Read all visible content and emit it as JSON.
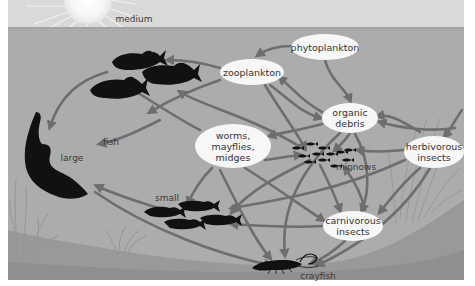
{
  "diagram": {
    "colors": {
      "sky": "#d9d9d9",
      "water": "#acacac",
      "water_deep": "#a2a2a2",
      "sediment": "#8f8f8f",
      "arrow": "#6e6e6e",
      "node_fill": "#f7f7f7",
      "organism": "#111111",
      "plants": "#979797"
    },
    "nodes": [
      {
        "id": "phytoplankton",
        "label": "phytoplankton",
        "x": 325,
        "y": 47,
        "w": 68,
        "h": 26
      },
      {
        "id": "zooplankton",
        "label": "zooplankton",
        "x": 252,
        "y": 72,
        "w": 64,
        "h": 26
      },
      {
        "id": "organic_debris",
        "label": "organic\ndebris",
        "x": 350,
        "y": 118,
        "w": 56,
        "h": 30
      },
      {
        "id": "worms",
        "label": "worms,\nmayflies,\nmidges",
        "x": 233,
        "y": 146,
        "w": 76,
        "h": 44
      },
      {
        "id": "herbivorous_insects",
        "label": "herbivorous\ninsects",
        "x": 434,
        "y": 152,
        "w": 60,
        "h": 32
      },
      {
        "id": "carnivorous_insects",
        "label": "carnivorous\ninsects",
        "x": 353,
        "y": 226,
        "w": 60,
        "h": 30
      }
    ],
    "labels": [
      {
        "id": "medium",
        "text": "medium",
        "x": 134,
        "y": 19
      },
      {
        "id": "fish",
        "text": "fish",
        "x": 111,
        "y": 142
      },
      {
        "id": "large",
        "text": "large",
        "x": 72,
        "y": 158
      },
      {
        "id": "small",
        "text": "small",
        "x": 167,
        "y": 198
      },
      {
        "id": "minnows",
        "text": "minnows",
        "x": 356,
        "y": 167
      },
      {
        "id": "crayfish",
        "text": "crayfish",
        "x": 318,
        "y": 276
      }
    ],
    "organisms": [
      {
        "id": "medium-fish",
        "count": 3
      },
      {
        "id": "large-fish",
        "count": 1
      },
      {
        "id": "small-fish",
        "count": 4
      },
      {
        "id": "minnows",
        "count": 12
      },
      {
        "id": "crayfish",
        "count": 1
      }
    ],
    "arrows": [
      {
        "from": "phytoplankton",
        "to": "zooplankton",
        "d": "M292,46 C280,46 268,48 258,55"
      },
      {
        "from": "phytoplankton",
        "to": "organic_debris",
        "d": "M325,60 C330,80 345,88 350,100"
      },
      {
        "from": "zooplankton",
        "to": "medium fish",
        "d": "M220,68 C200,62 185,60 168,60"
      },
      {
        "from": "organic_debris",
        "to": "zooplankton",
        "d": "M322,112 C300,100 295,90 280,78"
      },
      {
        "from": "zooplankton",
        "to": "organic_debris",
        "d": "M270,85 C290,100 300,112 320,118"
      },
      {
        "from": "organic_debris",
        "to": "worms",
        "d": "M322,124 C300,130 285,132 270,136"
      },
      {
        "from": "organic_debris",
        "to": "minnows",
        "d": "M350,133 C346,140 340,145 335,150"
      },
      {
        "from": "herbivorous_insects",
        "to": "organic_debris",
        "d": "M420,132 C400,120 390,114 378,116"
      },
      {
        "from": "herbivorous_insects",
        "to": "minnows",
        "d": "M404,150 C385,152 370,152 358,150"
      },
      {
        "from": "plants",
        "to": "herbivorous_insects",
        "d": "M462,110 C455,120 450,130 445,136"
      },
      {
        "from": "plants",
        "to": "organic_debris",
        "d": "M455,128 C430,132 400,128 380,122"
      },
      {
        "from": "worms",
        "to": "medium fish",
        "d": "M200,130 C180,120 150,100 130,88"
      },
      {
        "from": "worms",
        "to": "small fish",
        "d": "M212,168 C200,180 193,192 188,203"
      },
      {
        "from": "worms",
        "to": "minnows",
        "d": "M265,160 C280,158 290,156 300,155"
      },
      {
        "from": "zooplankton",
        "to": "minnows",
        "d": "M265,85 C280,110 295,130 305,148"
      },
      {
        "from": "zooplankton",
        "to": "medium fish",
        "d": "M220,80 C190,90 170,100 150,112"
      },
      {
        "from": "medium fish",
        "to": "large fish",
        "d": "M107,72 C80,80 60,95 50,127"
      },
      {
        "from": "worms",
        "to": "large fish",
        "d": "M160,120 C140,130 120,140 100,144"
      },
      {
        "from": "small fish",
        "to": "large fish",
        "d": "M170,212 C150,205 120,197 97,186"
      },
      {
        "from": "minnows",
        "to": "medium fish",
        "d": "M305,150 C260,120 200,105 180,92"
      },
      {
        "from": "minnows",
        "to": "small fish",
        "d": "M310,160 C280,175 250,190 232,212"
      },
      {
        "from": "minnows",
        "to": "carnivorous_insects",
        "d": "M320,165 C330,185 335,195 340,210"
      },
      {
        "from": "carnivorous_insects",
        "to": "minnows",
        "d": "M365,210 C362,195 355,182 345,168"
      },
      {
        "from": "carnivorous_insects",
        "to": "small fish",
        "d": "M323,226 C290,228 260,226 232,224"
      },
      {
        "from": "carnivorous_insects",
        "to": "crayfish",
        "d": "M345,241 C335,250 325,258 312,263"
      },
      {
        "from": "worms",
        "to": "carnivorous_insects",
        "d": "M245,168 C280,190 300,205 323,220"
      },
      {
        "from": "organic_debris",
        "to": "crayfish",
        "d": "M340,133 C300,170 280,210 285,255"
      },
      {
        "from": "herbivorous_insects",
        "to": "crayfish",
        "d": "M430,168 C400,220 350,250 318,265"
      },
      {
        "from": "herbivorous_insects",
        "to": "carnivorous_insects",
        "d": "M420,168 C400,185 390,200 380,212"
      },
      {
        "from": "large fish",
        "to": "crayfish",
        "d": "M95,192 C150,230 220,255 270,265"
      },
      {
        "from": "worms",
        "to": "crayfish",
        "d": "M220,170 C240,210 255,240 270,258"
      },
      {
        "from": "herbivorous_insects",
        "to": "small fish",
        "d": "M405,160 C340,190 280,200 232,208"
      },
      {
        "from": "organic_debris",
        "to": "carnivorous_insects",
        "d": "M355,134 C370,160 370,190 362,210"
      }
    ]
  }
}
